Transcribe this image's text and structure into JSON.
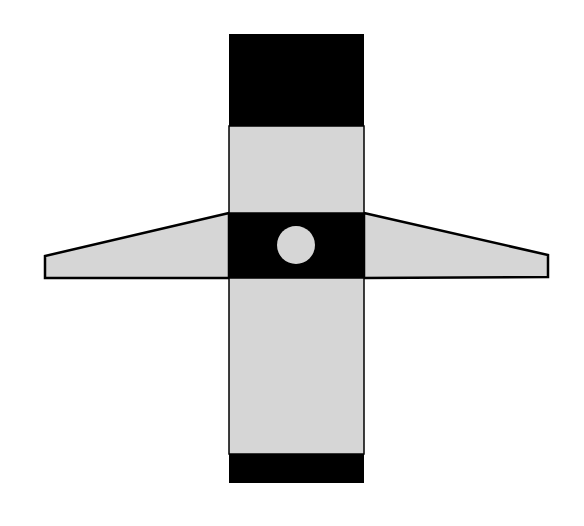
{
  "diagram": {
    "title": "",
    "colors": {
      "background": "#ffffff",
      "dark": "#000000",
      "light": "#d6d6d6",
      "outline": "#000000"
    },
    "shapes": {
      "vertical_bar": {
        "x": 229,
        "y": 34,
        "width": 135,
        "height": 449
      },
      "top_black_block": {
        "x": 229,
        "y": 34,
        "width": 135,
        "height": 92
      },
      "upper_light_block": {
        "x": 229,
        "y": 126,
        "width": 135,
        "height": 87
      },
      "center_black_band": {
        "x": 229,
        "y": 213,
        "width": 135,
        "height": 65
      },
      "lower_light_block": {
        "x": 229,
        "y": 278,
        "width": 135,
        "height": 176
      },
      "bottom_black_block": {
        "x": 229,
        "y": 454,
        "width": 135,
        "height": 29
      },
      "left_wing": {
        "points": "229,213 45,256 45,278 229,278"
      },
      "right_wing": {
        "points": "364,213 548,255 548,277 364,278"
      },
      "center_circle": {
        "cx": 296,
        "cy": 245,
        "r": 19
      }
    }
  }
}
